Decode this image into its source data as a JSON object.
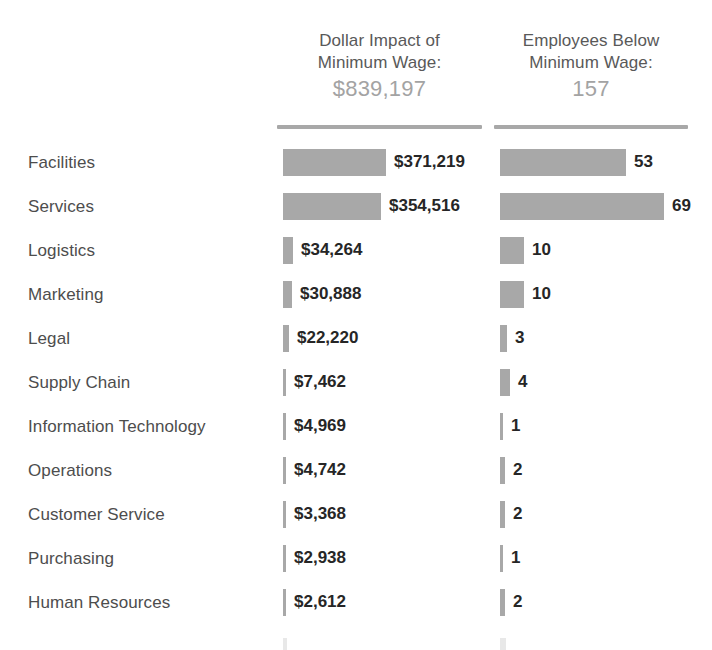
{
  "columns": [
    {
      "id": "dollar-impact",
      "title_line1": "Dollar Impact of",
      "title_line2": "Minimum Wage:",
      "total": "$839,197"
    },
    {
      "id": "employees-below",
      "title_line1": "Employees Below",
      "title_line2": "Minimum Wage:",
      "total": "157"
    }
  ],
  "colors": {
    "bar": "#a8a8a8",
    "label_text": "#4d4d4d",
    "value_text": "#262626",
    "header_text": "#595959",
    "total_text": "#a3a3a3",
    "background": "#ffffff"
  },
  "chart_data": {
    "type": "bar",
    "title": "",
    "xlabel": "",
    "ylabel": "",
    "grid": false,
    "legend": "none",
    "orientation": "horizontal",
    "categories": [
      "Facilities",
      "Services",
      "Logistics",
      "Marketing",
      "Legal",
      "Supply Chain",
      "Information Technology",
      "Operations",
      "Customer Service",
      "Purchasing",
      "Human Resources"
    ],
    "series": [
      {
        "name": "Dollar Impact of Minimum Wage",
        "total": 839197,
        "total_label": "$839,197",
        "values": [
          371219,
          354516,
          34264,
          30888,
          22220,
          7462,
          4969,
          4742,
          3368,
          2938,
          2612
        ],
        "labels": [
          "$371,219",
          "$354,516",
          "$34,264",
          "$30,888",
          "$22,220",
          "$7,462",
          "$4,969",
          "$4,742",
          "$3,368",
          "$2,938",
          "$2,612"
        ],
        "max": 371219
      },
      {
        "name": "Employees Below Minimum Wage",
        "total": 157,
        "total_label": "157",
        "values": [
          53,
          69,
          10,
          10,
          3,
          4,
          1,
          2,
          2,
          1,
          2
        ],
        "labels": [
          "53",
          "69",
          "10",
          "10",
          "3",
          "4",
          "1",
          "2",
          "2",
          "1",
          "2"
        ],
        "max": 69
      }
    ]
  },
  "clipped_bottom_row": {
    "label": "",
    "visible": true
  }
}
